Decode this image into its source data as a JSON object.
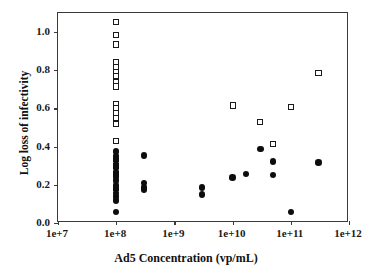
{
  "chart_data": {
    "type": "scatter",
    "title": "",
    "xlabel": "Ad5 Concentration (vp/mL)",
    "ylabel": "Log loss of infectivity",
    "xscale": "log",
    "xlim": [
      10000000.0,
      1000000000000.0
    ],
    "ylim": [
      0.0,
      1.1
    ],
    "yticks": [
      "1.0",
      "0.8",
      "0.6",
      "0.4",
      "0.2",
      "0.0"
    ],
    "ytick_values": [
      1.0,
      0.8,
      0.6,
      0.4,
      0.2,
      0.0
    ],
    "xticks": [
      "1e+7",
      "1e+8",
      "1e+9",
      "1e+10",
      "1e+11",
      "1e+12"
    ],
    "xtick_values": [
      10000000.0,
      100000000.0,
      1000000000.0,
      10000000000.0,
      100000000000.0,
      1000000000000.0
    ],
    "grid": false,
    "legend": "none",
    "marker_colors": {
      "open_square_edge": "#1a1a1a",
      "open_square_fill": "#ffffff",
      "filled_circle": "#0d0d0d",
      "axis": "#3a3a3a"
    },
    "series": [
      {
        "name": "open-squares",
        "marker": "open-square",
        "points": [
          [
            100000000.0,
            1.052
          ],
          [
            100000000.0,
            0.985
          ],
          [
            100000000.0,
            0.935
          ],
          [
            100000000.0,
            0.845
          ],
          [
            100000000.0,
            0.818
          ],
          [
            100000000.0,
            0.793
          ],
          [
            100000000.0,
            0.768
          ],
          [
            100000000.0,
            0.74
          ],
          [
            100000000.0,
            0.715
          ],
          [
            100000000.0,
            0.625
          ],
          [
            100000000.0,
            0.6
          ],
          [
            100000000.0,
            0.575
          ],
          [
            100000000.0,
            0.548
          ],
          [
            100000000.0,
            0.52
          ],
          [
            100000000.0,
            0.428
          ],
          [
            100000000.0,
            0.338
          ],
          [
            100000000.0,
            0.3
          ],
          [
            100000000.0,
            0.255
          ],
          [
            100000000.0,
            0.185
          ],
          [
            10000000000.0,
            0.615
          ],
          [
            30000000000.0,
            0.53
          ],
          [
            50000000000.0,
            0.412
          ],
          [
            100000000000.0,
            0.607
          ],
          [
            300000000000.0,
            0.785
          ]
        ]
      },
      {
        "name": "filled-circles",
        "marker": "filled-circle",
        "points": [
          [
            100000000.0,
            0.375
          ],
          [
            100000000.0,
            0.352
          ],
          [
            100000000.0,
            0.33
          ],
          [
            100000000.0,
            0.31
          ],
          [
            100000000.0,
            0.288
          ],
          [
            100000000.0,
            0.265
          ],
          [
            100000000.0,
            0.243
          ],
          [
            100000000.0,
            0.222
          ],
          [
            100000000.0,
            0.2
          ],
          [
            100000000.0,
            0.178
          ],
          [
            100000000.0,
            0.158
          ],
          [
            100000000.0,
            0.138
          ],
          [
            100000000.0,
            0.118
          ],
          [
            100000000.0,
            0.058
          ],
          [
            300000000.0,
            0.353
          ],
          [
            300000000.0,
            0.208
          ],
          [
            300000000.0,
            0.19
          ],
          [
            300000000.0,
            0.175
          ],
          [
            3000000000.0,
            0.185
          ],
          [
            3000000000.0,
            0.15
          ],
          [
            10000000000.0,
            0.238
          ],
          [
            17000000000.0,
            0.258
          ],
          [
            30000000000.0,
            0.388
          ],
          [
            50000000000.0,
            0.322
          ],
          [
            50000000000.0,
            0.25
          ],
          [
            100000000000.0,
            0.057
          ],
          [
            300000000000.0,
            0.317
          ]
        ]
      }
    ]
  }
}
